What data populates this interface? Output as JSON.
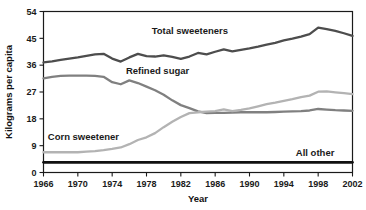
{
  "chart_data": {
    "type": "line",
    "title": "",
    "xlabel": "Year",
    "ylabel": "Kilograms per capita",
    "xlim": [
      1966,
      2002
    ],
    "ylim": [
      0,
      54
    ],
    "ytick_labels": [
      "0",
      "9",
      "18",
      "27",
      "36",
      "45",
      "54"
    ],
    "yticks": [
      0,
      9,
      18,
      27,
      36,
      45,
      54
    ],
    "xtick_labels": [
      "1966",
      "1970",
      "1974",
      "1978",
      "1982",
      "1986",
      "1990",
      "1994",
      "1998",
      "2002"
    ],
    "xticks": [
      1966,
      1970,
      1974,
      1978,
      1982,
      1986,
      1990,
      1994,
      1998,
      2002
    ],
    "grid": false,
    "legend_position": "inline-annotations",
    "x": [
      1966,
      1967,
      1968,
      1969,
      1970,
      1971,
      1972,
      1973,
      1974,
      1975,
      1976,
      1977,
      1978,
      1979,
      1980,
      1981,
      1982,
      1983,
      1984,
      1985,
      1986,
      1987,
      1988,
      1989,
      1990,
      1991,
      1992,
      1993,
      1994,
      1995,
      1996,
      1997,
      1998,
      1999,
      2000,
      2001,
      2002
    ],
    "series": [
      {
        "name": "Total sweeteners",
        "color": "#4d4d4d",
        "label": "Total sweeteners",
        "label_x": 1978.6,
        "label_y": 46.6,
        "values": [
          36.9,
          37.3,
          37.8,
          38.2,
          38.6,
          39.1,
          39.6,
          39.8,
          38.2,
          37.2,
          38.6,
          39.8,
          39.0,
          38.9,
          39.3,
          38.8,
          38.1,
          38.9,
          40.1,
          39.6,
          40.5,
          41.3,
          40.6,
          41.1,
          41.6,
          42.2,
          42.9,
          43.5,
          44.3,
          44.9,
          45.6,
          46.4,
          48.6,
          48.1,
          47.5,
          46.7,
          45.8
        ]
      },
      {
        "name": "Refined sugar",
        "color": "#808080",
        "label": "Refined sugar",
        "label_x": 1975.6,
        "label_y": 33.1,
        "values": [
          31.6,
          32.1,
          32.4,
          32.5,
          32.5,
          32.5,
          32.4,
          32.1,
          30.3,
          29.6,
          30.9,
          30.0,
          28.8,
          27.6,
          26.1,
          24.2,
          22.6,
          21.6,
          20.5,
          19.9,
          20.0,
          20.0,
          20.1,
          20.2,
          20.2,
          20.2,
          20.2,
          20.3,
          20.4,
          20.5,
          20.6,
          20.8,
          21.3,
          21.1,
          20.9,
          20.8,
          20.7
        ]
      },
      {
        "name": "Corn sweetener",
        "color": "#b3b3b3",
        "label": "Corn sweetener",
        "label_x": 1966.5,
        "label_y": 11.0,
        "values": [
          6.8,
          6.8,
          6.8,
          6.8,
          6.8,
          7.0,
          7.2,
          7.5,
          7.9,
          8.4,
          9.5,
          10.9,
          11.8,
          13.2,
          15.2,
          17.0,
          18.6,
          19.9,
          20.2,
          20.4,
          20.6,
          21.2,
          20.6,
          21.0,
          21.5,
          22.2,
          22.9,
          23.4,
          24.0,
          24.6,
          25.3,
          25.8,
          27.1,
          27.2,
          26.9,
          26.6,
          26.3
        ]
      },
      {
        "name": "All other",
        "color": "#111111",
        "label": "All other",
        "label_x": 1995.4,
        "label_y": 5.7,
        "values": [
          3.4,
          3.4,
          3.4,
          3.4,
          3.4,
          3.4,
          3.4,
          3.4,
          3.4,
          3.4,
          3.4,
          3.4,
          3.4,
          3.4,
          3.4,
          3.4,
          3.4,
          3.4,
          3.4,
          3.4,
          3.4,
          3.4,
          3.4,
          3.4,
          3.4,
          3.4,
          3.4,
          3.4,
          3.4,
          3.4,
          3.4,
          3.4,
          3.4,
          3.4,
          3.4,
          3.4,
          3.4
        ]
      }
    ]
  },
  "colors": {
    "axis": "#1a1a1a",
    "background": "#ffffff",
    "total_sweeteners": "#4d4d4d",
    "refined_sugar": "#808080",
    "corn_sweetener": "#b3b3b3",
    "all_other": "#111111"
  }
}
